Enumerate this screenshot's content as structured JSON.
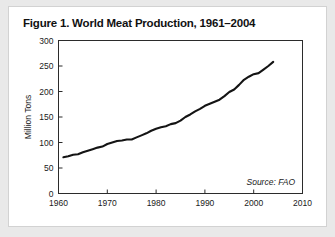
{
  "figure": {
    "title": "Figure 1. World Meat Production, 1961–2004",
    "card_background": "#ffffff",
    "page_background": "#e9e9e9"
  },
  "chart_data": {
    "type": "line",
    "title": "Figure 1. World Meat Production, 1961–2004",
    "subtitle": "",
    "xlabel": "",
    "ylabel": "Million Tons",
    "xlim": [
      1960,
      2010
    ],
    "ylim": [
      0,
      300
    ],
    "xticks": [
      1960,
      1970,
      1980,
      1990,
      2000,
      2010
    ],
    "yticks": [
      0,
      50,
      100,
      150,
      200,
      250,
      300
    ],
    "xtick_labels": [
      "1960",
      "1970",
      "1980",
      "1990",
      "2000",
      "2010"
    ],
    "ytick_labels": [
      "0",
      "50",
      "100",
      "150",
      "200",
      "250",
      "300"
    ],
    "grid": false,
    "legend": false,
    "legend_position": "none",
    "line_color": "#141414",
    "annotations": [
      {
        "text": "Source: FAO",
        "x": 2001,
        "y": 18,
        "style": "italic"
      }
    ],
    "series": [
      {
        "name": "World Meat Production",
        "units": "Million Tons",
        "x": [
          1961,
          1962,
          1963,
          1964,
          1965,
          1966,
          1967,
          1968,
          1969,
          1970,
          1971,
          1972,
          1973,
          1974,
          1975,
          1976,
          1977,
          1978,
          1979,
          1980,
          1981,
          1982,
          1983,
          1984,
          1985,
          1986,
          1987,
          1988,
          1989,
          1990,
          1991,
          1992,
          1993,
          1994,
          1995,
          1996,
          1997,
          1998,
          1999,
          2000,
          2001,
          2002,
          2003,
          2004
        ],
        "values": [
          71,
          73,
          76,
          77,
          81,
          84,
          87,
          90,
          92,
          97,
          100,
          103,
          104,
          106,
          106,
          110,
          114,
          118,
          123,
          127,
          130,
          132,
          136,
          138,
          143,
          150,
          155,
          161,
          166,
          172,
          176,
          180,
          184,
          191,
          199,
          204,
          213,
          223,
          229,
          234,
          236,
          243,
          250,
          258
        ]
      }
    ]
  }
}
